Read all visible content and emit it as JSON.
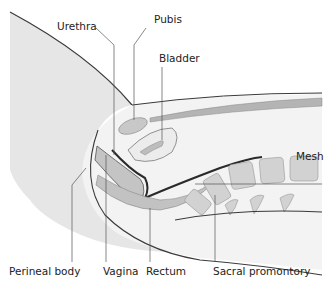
{
  "figure": {
    "type": "anatomical cross-section"
  },
  "labels": {
    "urethra": "Urethra",
    "pubis": "Pubis",
    "bladder": "Bladder",
    "mesh": "Mesh",
    "perineal_body": "Perineal body",
    "vagina": "Vagina",
    "rectum": "Rectum",
    "sacral_promontory": "Sacral promontory"
  },
  "colors": {
    "skin": "#e4e4e4",
    "tissue": "#f1f1f1",
    "organ": "#c8c8c8",
    "organ_dark": "#a9a9a9",
    "outline": "#3a3a3a",
    "leader": "#555555"
  }
}
